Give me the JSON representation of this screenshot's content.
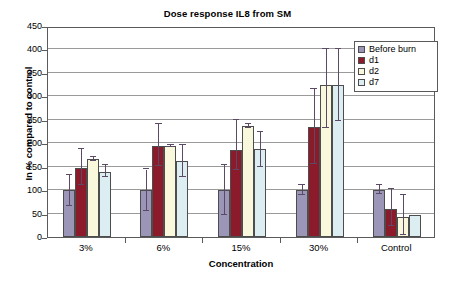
{
  "chart_data": {
    "type": "bar",
    "title": "Dose response IL8 from SM",
    "xlabel": "Concentration",
    "ylabel": "In % compared to control",
    "categories": [
      "3%",
      "6%",
      "15%",
      "30%",
      "Control"
    ],
    "ylim": [
      0,
      450
    ],
    "yticks": [
      0,
      50,
      100,
      150,
      200,
      250,
      300,
      350,
      400,
      450
    ],
    "grid": true,
    "legend_position": "top-right",
    "series": [
      {
        "name": "Before burn",
        "color": "#9b96b8",
        "values": [
          100,
          100,
          100,
          100,
          100
        ],
        "err_low": [
          33,
          44,
          54,
          10,
          8
        ],
        "err_high": [
          33,
          44,
          54,
          10,
          10
        ]
      },
      {
        "name": "d1",
        "color": "#8b1a2b",
        "values": [
          148,
          195,
          185,
          235,
          59
        ],
        "err_low": [
          38,
          44,
          42,
          80,
          36
        ],
        "err_high": [
          39,
          47,
          65,
          80,
          44
        ]
      },
      {
        "name": "d2",
        "color": "#faf8dc",
        "values": [
          167,
          194,
          237,
          324,
          42
        ],
        "err_low": [
          4,
          3,
          4,
          92,
          38
        ],
        "err_high": [
          4,
          3,
          4,
          76,
          48
        ]
      },
      {
        "name": "d7",
        "color": "#dceef2",
        "values": [
          139,
          162,
          187,
          324,
          48
        ],
        "err_low": [
          12,
          33,
          38,
          76,
          0
        ],
        "err_high": [
          15,
          35,
          37,
          76,
          0
        ]
      }
    ]
  },
  "legend": {
    "items": [
      {
        "label": "Before burn",
        "color": "#9b96b8"
      },
      {
        "label": "d1",
        "color": "#8b1a2b"
      },
      {
        "label": "d2",
        "color": "#faf8dc"
      },
      {
        "label": "d7",
        "color": "#dceef2"
      }
    ]
  }
}
